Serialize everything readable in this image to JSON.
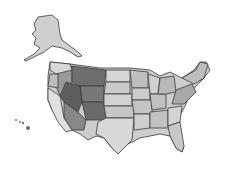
{
  "map": {
    "title": "",
    "subject": "United States (grayscale)",
    "colors": {
      "background": "#ffffff",
      "light_state": "#d4d4d4",
      "mid_state": "#a8a8a8",
      "dark_state": "#6e6e6e",
      "outline": "#3a3a3a"
    },
    "highlighted_region": [
      "Montana",
      "Idaho",
      "Wyoming",
      "Nevada",
      "Utah",
      "Colorado",
      "Oregon (east)",
      "Arizona (north)"
    ],
    "insets": [
      "Alaska",
      "Hawaii"
    ]
  }
}
